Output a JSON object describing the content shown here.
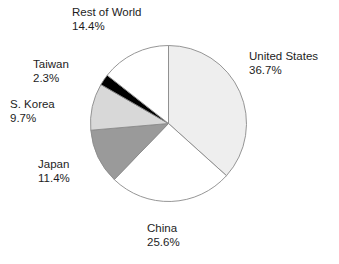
{
  "chart_data": {
    "type": "pie",
    "title": "",
    "subtitle": "",
    "xlabel": "",
    "ylabel": "",
    "legend_position": "none",
    "grid": false,
    "units": "percent",
    "start_angle_deg": 0,
    "direction": "clockwise",
    "categories": [
      "United States",
      "China",
      "Japan",
      "S. Korea",
      "Taiwan",
      "Rest of World"
    ],
    "values": [
      36.7,
      25.6,
      11.4,
      9.7,
      2.3,
      14.4
    ],
    "slices": [
      {
        "label": "United States",
        "value": 36.7,
        "value_text": "36.7%",
        "color": "#eeeeee"
      },
      {
        "label": "China",
        "value": 25.6,
        "value_text": "25.6%",
        "color": "#ffffff"
      },
      {
        "label": "Japan",
        "value": 11.4,
        "value_text": "11.4%",
        "color": "#9a9a9a"
      },
      {
        "label": "S. Korea",
        "value": 9.7,
        "value_text": "9.7%",
        "color": "#d8d8d8"
      },
      {
        "label": "Taiwan",
        "value": 2.3,
        "value_text": "2.3%",
        "color": "#000000"
      },
      {
        "label": "Rest of World",
        "value": 14.4,
        "value_text": "14.4%",
        "color": "#ffffff"
      }
    ]
  },
  "labels": {
    "united_states": {
      "name": "United States",
      "value": "36.7%"
    },
    "china": {
      "name": "China",
      "value": "25.6%"
    },
    "japan": {
      "name": "Japan",
      "value": "11.4%"
    },
    "s_korea": {
      "name": "S. Korea",
      "value": "9.7%"
    },
    "taiwan": {
      "name": "Taiwan",
      "value": "2.3%"
    },
    "rest_of_world": {
      "name": "Rest of World",
      "value": "14.4%"
    }
  },
  "colors": {
    "outline": "#8a8a8a",
    "text": "#1d1d1d",
    "background": "#ffffff"
  }
}
